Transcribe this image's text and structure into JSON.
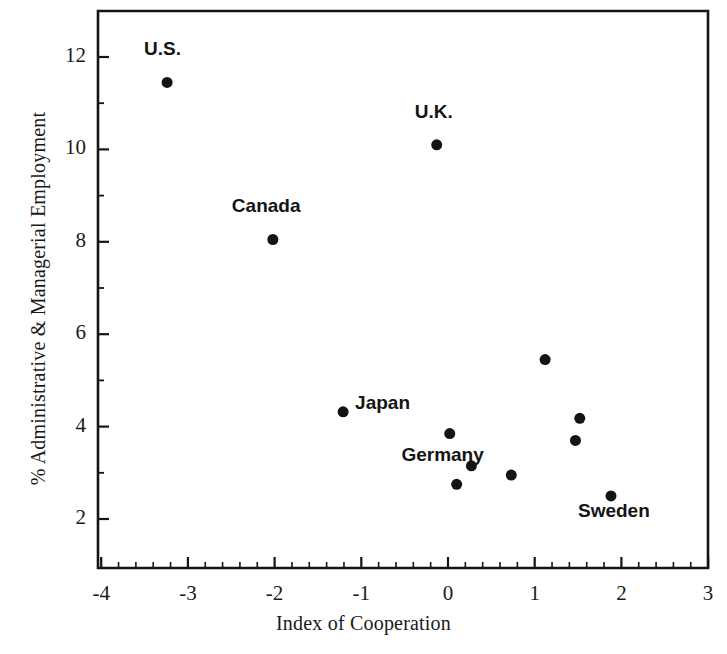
{
  "chart_data": {
    "type": "scatter",
    "title": "",
    "xlabel": "Index of Cooperation",
    "ylabel": "% Administrative & Managerial Employment",
    "xlim": [
      -4,
      3
    ],
    "ylim": [
      1,
      12.8
    ],
    "grid": false,
    "legend": "none",
    "x_ticks": [
      {
        "value": -4,
        "label": "-4"
      },
      {
        "value": -3,
        "label": "-3"
      },
      {
        "value": -2,
        "label": "-2"
      },
      {
        "value": -1,
        "label": "-1"
      },
      {
        "value": 0,
        "label": "0"
      },
      {
        "value": 1,
        "label": "1"
      },
      {
        "value": 2,
        "label": "2"
      },
      {
        "value": 3,
        "label": "3"
      }
    ],
    "y_ticks": [
      {
        "value": 2,
        "label": "2"
      },
      {
        "value": 4,
        "label": "4"
      },
      {
        "value": 6,
        "label": "6"
      },
      {
        "value": 8,
        "label": "8"
      },
      {
        "value": 10,
        "label": "10"
      },
      {
        "value": 12,
        "label": "12"
      }
    ],
    "x_minor_interval": 0.2,
    "y_minor_interval": 1,
    "marker_color": "#141414",
    "marker_size": 11,
    "points": [
      {
        "label": "U.S.",
        "x": -3.24,
        "y": 11.45,
        "label_dx": -23,
        "label_dy": -34
      },
      {
        "label": "U.K.",
        "x": -0.13,
        "y": 10.1,
        "label_dx": -22,
        "label_dy": -34
      },
      {
        "label": "Canada",
        "x": -2.02,
        "y": 8.05,
        "label_dx": -41,
        "label_dy": -34
      },
      {
        "label": "Japan",
        "x": -1.21,
        "y": 4.32,
        "label_dx": 12,
        "label_dy": -10
      },
      {
        "label": "Germany",
        "x": 0.27,
        "y": 3.15,
        "label_dx": -70,
        "label_dy": -12
      },
      {
        "label": "Sweden",
        "x": 1.88,
        "y": 2.5,
        "label_dx": -33,
        "label_dy": 14
      },
      {
        "label": "",
        "x": 0.02,
        "y": 3.85,
        "label_dx": 0,
        "label_dy": 0
      },
      {
        "label": "",
        "x": 0.1,
        "y": 2.75,
        "label_dx": 0,
        "label_dy": 0
      },
      {
        "label": "",
        "x": 0.73,
        "y": 2.95,
        "label_dx": 0,
        "label_dy": 0
      },
      {
        "label": "",
        "x": 1.12,
        "y": 5.45,
        "label_dx": 0,
        "label_dy": 0
      },
      {
        "label": "",
        "x": 1.52,
        "y": 4.18,
        "label_dx": 0,
        "label_dy": 0
      },
      {
        "label": "",
        "x": 1.47,
        "y": 3.7,
        "label_dx": 0,
        "label_dy": 0
      }
    ]
  }
}
